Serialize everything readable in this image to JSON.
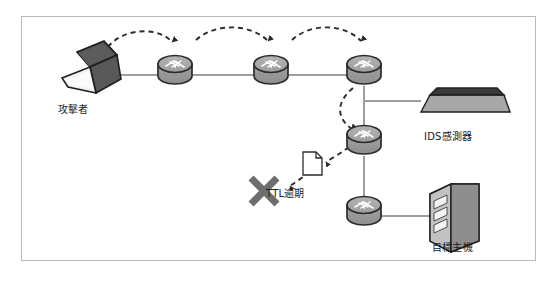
{
  "diagram": {
    "frame": {
      "border_color": "#b9b9b9",
      "background": "#ffffff"
    },
    "colors": {
      "router_body": "#9a9a9a",
      "router_top": "#adadad",
      "router_outline": "#2b2b2b",
      "link_line": "#9e9e9e",
      "dashed_arrow": "#2b2b2b",
      "laptop_screen": "#4a4a4a",
      "laptop_base": "#efefef",
      "ids_top": "#3a3a3a",
      "ids_body": "#a8a8a8",
      "server_front": "#b0b0b0",
      "server_side": "#8e8e8e",
      "x_mark": "#6e6e6e",
      "label_text": "#1a1a1a"
    },
    "nodes": [
      {
        "id": "attacker",
        "type": "laptop",
        "label": "攻擊者",
        "x": 95,
        "y": 68
      },
      {
        "id": "router1",
        "type": "router",
        "label": "",
        "x": 174,
        "y": 66
      },
      {
        "id": "router2",
        "type": "router",
        "label": "",
        "x": 271,
        "y": 66
      },
      {
        "id": "router3",
        "type": "router",
        "label": "",
        "x": 364,
        "y": 66
      },
      {
        "id": "router4",
        "type": "router",
        "label": "",
        "x": 364,
        "y": 136
      },
      {
        "id": "router5",
        "type": "router",
        "label": "",
        "x": 364,
        "y": 207
      },
      {
        "id": "ids-sensor",
        "type": "appliance",
        "label": "IDS感測器",
        "x": 464,
        "y": 98
      },
      {
        "id": "target-host",
        "type": "server",
        "label": "目標主機",
        "x": 456,
        "y": 212
      },
      {
        "id": "packet",
        "type": "document",
        "label": "",
        "x": 314,
        "y": 160
      },
      {
        "id": "ttl-expired",
        "type": "x-mark",
        "label": "TTL逾期",
        "x": 258,
        "y": 190
      }
    ],
    "links": [
      {
        "from": "attacker",
        "to": "router1",
        "style": "solid"
      },
      {
        "from": "router1",
        "to": "router2",
        "style": "solid"
      },
      {
        "from": "router2",
        "to": "router3",
        "style": "solid"
      },
      {
        "from": "router3",
        "to": "router4",
        "style": "solid"
      },
      {
        "from": "router4",
        "to": "router5",
        "style": "solid"
      },
      {
        "from": "router3",
        "to": "ids-sensor",
        "style": "solid"
      },
      {
        "from": "router5",
        "to": "target-host",
        "style": "solid"
      }
    ],
    "hops": [
      {
        "from": "attacker",
        "to": "router1",
        "style": "dashed-arc"
      },
      {
        "from": "router1",
        "to": "router2",
        "style": "dashed-arc"
      },
      {
        "from": "router2",
        "to": "router3",
        "style": "dashed-arc"
      },
      {
        "from": "router3",
        "to": "router4",
        "style": "dashed-curve"
      },
      {
        "from": "router4",
        "to": "ttl-expired",
        "style": "dashed-drop"
      }
    ],
    "labels": {
      "attacker": "攻擊者",
      "ids_sensor": "IDS感測器",
      "target_host": "目標主機",
      "ttl_expired": "TTL逾期"
    }
  }
}
